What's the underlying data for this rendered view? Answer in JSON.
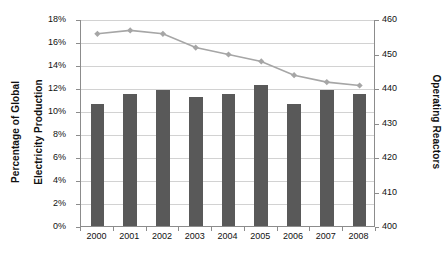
{
  "chart_data": {
    "type": "bar",
    "title": "",
    "xlabel": "",
    "categories": [
      "2000",
      "2001",
      "2002",
      "2003",
      "2004",
      "2005",
      "2006",
      "2007",
      "2008"
    ],
    "grid": true,
    "legend": "none",
    "series": [
      {
        "name": "Percentage of Global Electricity Production",
        "type": "bar",
        "axis": "left",
        "color": "#595959",
        "values": [
          10.6,
          11.5,
          11.8,
          11.2,
          11.5,
          12.3,
          10.6,
          11.8,
          11.5
        ]
      },
      {
        "name": "Operating Reactors",
        "type": "line",
        "axis": "right",
        "color": "#a6a6a6",
        "values": [
          456,
          457,
          456,
          452,
          450,
          448,
          444,
          442,
          441
        ]
      }
    ],
    "axes": {
      "left": {
        "label": "Percentage of Global Electricity Production",
        "label_line1": "Percentage of Global",
        "label_line2": "Electricity Production",
        "ylim": [
          0,
          18
        ],
        "tick_step": 2,
        "ticks": [
          "0%",
          "2%",
          "4%",
          "6%",
          "8%",
          "10%",
          "12%",
          "14%",
          "16%",
          "18%"
        ]
      },
      "right": {
        "label": "Operating Reactors",
        "ylim": [
          400,
          460
        ],
        "tick_step": 10,
        "ticks": [
          "400",
          "410",
          "420",
          "430",
          "440",
          "450",
          "460"
        ]
      }
    }
  },
  "colors": {
    "bar": "#595959",
    "line": "#a6a6a6",
    "grid": "#d2d2d2",
    "axis": "#8c8c8c",
    "background": "#ffffff",
    "text": "#111111"
  }
}
